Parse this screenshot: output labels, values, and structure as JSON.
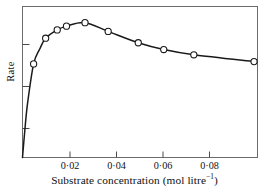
{
  "chart_data": {
    "type": "line",
    "title": "",
    "subtitle": "",
    "xlabel_text": "Substrate concentration (mol litre",
    "xlabel_exponent": "−1",
    "xlabel_close": ")",
    "xlabel_full": "Substrate concentration (mol litre⁻¹)",
    "ylabel": "Rate",
    "xlim": [
      0,
      0.1015
    ],
    "ylim": [
      0,
      1.0
    ],
    "grid": false,
    "legend": null,
    "marker": "open-circle",
    "xticks": [
      0.02,
      0.04,
      0.06,
      0.08
    ],
    "xtick_labels": [
      "0·02",
      "0·04",
      "0·06",
      "0·08"
    ],
    "yticks": [
      0.25,
      0.5,
      0.75
    ],
    "ytick_labels": [
      "",
      "",
      ""
    ],
    "series": [
      {
        "name": "rate",
        "x": [
          0.0,
          0.001,
          0.0022,
          0.0048,
          0.0075,
          0.01,
          0.015,
          0.019,
          0.027,
          0.037,
          0.05,
          0.061,
          0.074,
          0.1
        ],
        "values": [
          0.0,
          0.18,
          0.36,
          0.62,
          0.72,
          0.79,
          0.845,
          0.87,
          0.893,
          0.835,
          0.76,
          0.715,
          0.68,
          0.635
        ]
      }
    ],
    "markers": {
      "x": [
        0.0048,
        0.01,
        0.015,
        0.019,
        0.027,
        0.037,
        0.05,
        0.061,
        0.074,
        0.1
      ],
      "values": [
        0.62,
        0.79,
        0.845,
        0.87,
        0.893,
        0.835,
        0.76,
        0.715,
        0.68,
        0.635
      ]
    },
    "colors": {
      "line": "#1a1a1a",
      "marker_fill": "#ffffff",
      "marker_stroke": "#1a1a1a",
      "axis": "#555555",
      "text": "#111111",
      "background": "#ffffff"
    }
  }
}
